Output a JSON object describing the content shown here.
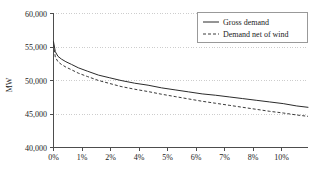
{
  "chart_data": {
    "type": "line",
    "title": "",
    "xlabel": "",
    "ylabel": "MW",
    "ylim": [
      40000,
      60000
    ],
    "xlim": [
      0,
      11.3
    ],
    "grid": true,
    "legend_position": "top-right",
    "y_ticks": [
      "40,000",
      "45,000",
      "50,000",
      "55,000",
      "60,000"
    ],
    "y_tick_values": [
      40000,
      45000,
      50000,
      55000,
      60000
    ],
    "x_ticks": [
      "0%",
      "1%",
      "2%",
      "4%",
      "5%",
      "6%",
      "7%",
      "8%",
      "10%"
    ],
    "x_tick_values": [
      0,
      1,
      2,
      4,
      5,
      6,
      7,
      8,
      10
    ],
    "series": [
      {
        "name": "Gross demand",
        "style": "solid",
        "color": "#2b2b2b",
        "x": [
          0,
          0.08,
          0.2,
          0.35,
          0.55,
          0.8,
          1.1,
          1.5,
          2.0,
          2.5,
          3.0,
          3.6,
          4.2,
          4.8,
          5.4,
          6.0,
          6.6,
          7.2,
          7.8,
          8.4,
          9.0,
          9.6,
          10.2,
          10.8,
          11.3
        ],
        "values": [
          55800,
          54300,
          53600,
          53200,
          52800,
          52400,
          51900,
          51400,
          50800,
          50400,
          50000,
          49600,
          49300,
          48900,
          48600,
          48300,
          48000,
          47800,
          47550,
          47300,
          47050,
          46800,
          46550,
          46200,
          46000
        ]
      },
      {
        "name": "Demand net of wind",
        "style": "dashed",
        "color": "#3a3a3a",
        "x": [
          0,
          0.08,
          0.2,
          0.35,
          0.55,
          0.8,
          1.1,
          1.5,
          2.0,
          2.5,
          3.0,
          3.6,
          4.2,
          4.8,
          5.4,
          6.0,
          6.6,
          7.2,
          7.8,
          8.4,
          9.0,
          9.6,
          10.2,
          10.8,
          11.3
        ],
        "values": [
          55400,
          53500,
          52800,
          52400,
          52000,
          51600,
          51100,
          50600,
          50000,
          49550,
          49100,
          48700,
          48350,
          47950,
          47600,
          47250,
          46900,
          46600,
          46300,
          46000,
          45700,
          45400,
          45150,
          44850,
          44650
        ]
      }
    ]
  },
  "legend": {
    "entries": [
      {
        "label": "Gross demand",
        "style": "solid"
      },
      {
        "label": "Demand net of wind",
        "style": "dashed"
      }
    ]
  },
  "axes": {
    "y_title": "MW"
  }
}
